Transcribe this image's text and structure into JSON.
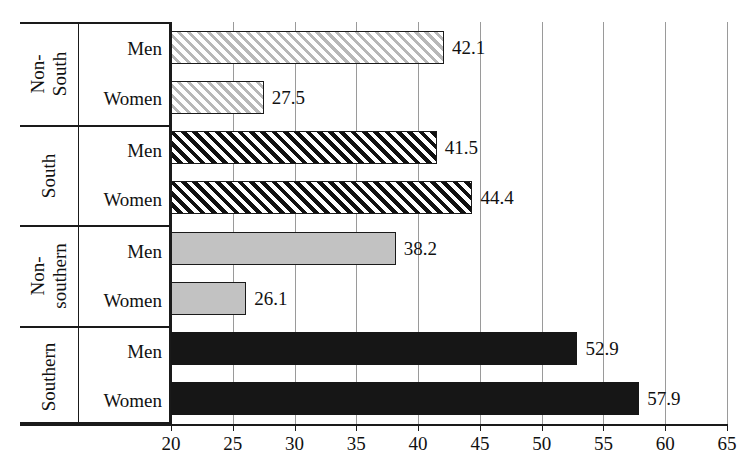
{
  "chart_data": {
    "type": "bar",
    "orientation": "horizontal",
    "title": "",
    "xlabel": "",
    "ylabel": "",
    "xlim": [
      20,
      65
    ],
    "xticks": [
      20,
      25,
      30,
      35,
      40,
      45,
      50,
      55,
      60,
      65
    ],
    "xtick_labels": [
      "20",
      "25",
      "30",
      "35",
      "40",
      "45",
      "50",
      "55",
      "60",
      "65"
    ],
    "grid": true,
    "grid_axis": "x",
    "legend": "none",
    "groups": [
      {
        "name": "Non-South",
        "name_lines": [
          "Non-",
          "South"
        ],
        "style": "hatch-light",
        "bars": [
          {
            "label": "Men",
            "value": 42.1,
            "value_label": "42.1"
          },
          {
            "label": "Women",
            "value": 27.5,
            "value_label": "27.5"
          }
        ]
      },
      {
        "name": "South",
        "name_lines": [
          "South"
        ],
        "style": "hatch-dark",
        "bars": [
          {
            "label": "Men",
            "value": 41.5,
            "value_label": "41.5"
          },
          {
            "label": "Women",
            "value": 44.4,
            "value_label": "44.4"
          }
        ]
      },
      {
        "name": "Non-southern",
        "name_lines": [
          "Non-",
          "southern"
        ],
        "style": "solid-gray",
        "bars": [
          {
            "label": "Men",
            "value": 38.2,
            "value_label": "38.2"
          },
          {
            "label": "Women",
            "value": 26.1,
            "value_label": "26.1"
          }
        ]
      },
      {
        "name": "Southern",
        "name_lines": [
          "Southern"
        ],
        "style": "solid-black",
        "bars": [
          {
            "label": "Men",
            "value": 52.9,
            "value_label": "52.9"
          },
          {
            "label": "Women",
            "value": 57.9,
            "value_label": "57.9"
          }
        ]
      }
    ],
    "categories": [
      "Non-South Men",
      "Non-South Women",
      "South Men",
      "South Women",
      "Non-southern Men",
      "Non-southern Women",
      "Southern Men",
      "Southern Women"
    ],
    "values": [
      42.1,
      27.5,
      41.5,
      44.4,
      38.2,
      26.1,
      52.9,
      57.9
    ]
  },
  "colors": {
    "hatch_light_line": "#b8b8b8",
    "hatch_dark_line": "#111111",
    "solid_gray": "#c2c2c2",
    "solid_black": "#161616",
    "gridline": "#9a9a9a",
    "axis": "#1a1a1a",
    "background": "#ffffff",
    "text": "#111111"
  }
}
